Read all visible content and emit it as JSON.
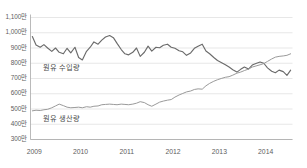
{
  "chart_data": {
    "type": "line",
    "title": "",
    "subtitle": "",
    "xlabel": "",
    "ylabel": "",
    "unit_suffix": "만",
    "grid": true,
    "legend_position": "inline-annotation",
    "ylim": [
      300,
      1100
    ],
    "yticks": [
      1100,
      1000,
      900,
      800,
      700,
      600,
      500,
      400,
      300
    ],
    "ytick_labels": [
      "1,100만",
      "1,000만",
      "900만",
      "800만",
      "700만",
      "600만",
      "500만",
      "400만",
      "300만"
    ],
    "xlim": [
      2008.92,
      2014.58
    ],
    "xticks": [
      2009,
      2010,
      2011,
      2012,
      2013,
      2014
    ],
    "xtick_labels": [
      "2009",
      "2010",
      "2011",
      "2012",
      "2013",
      "2014"
    ],
    "colors": {
      "imports_line": "#6b6b6b",
      "production_line": "#9a9a9a",
      "grid": "#dcdcdc",
      "axis": "#a8a8a8",
      "tick_text": "#5d5d5d",
      "label_text": "#4a4a4a",
      "background": "#ffffff"
    },
    "series": [
      {
        "name": "원유 수입량",
        "label_x": 2009.2,
        "label_y": 772,
        "color": "#6b6b6b",
        "x": [
          2008.96,
          2009.04,
          2009.13,
          2009.21,
          2009.29,
          2009.38,
          2009.46,
          2009.54,
          2009.63,
          2009.71,
          2009.79,
          2009.88,
          2009.96,
          2010.04,
          2010.13,
          2010.21,
          2010.29,
          2010.38,
          2010.46,
          2010.54,
          2010.63,
          2010.71,
          2010.79,
          2010.88,
          2010.96,
          2011.04,
          2011.13,
          2011.21,
          2011.29,
          2011.38,
          2011.46,
          2011.54,
          2011.63,
          2011.71,
          2011.79,
          2011.88,
          2011.96,
          2012.04,
          2012.13,
          2012.21,
          2012.29,
          2012.38,
          2012.46,
          2012.54,
          2012.63,
          2012.71,
          2012.79,
          2012.88,
          2012.96,
          2013.04,
          2013.13,
          2013.21,
          2013.29,
          2013.38,
          2013.46,
          2013.54,
          2013.63,
          2013.71,
          2013.79,
          2013.88,
          2013.96,
          2014.04,
          2014.13,
          2014.21,
          2014.29,
          2014.38,
          2014.46,
          2014.54
        ],
        "values": [
          975,
          920,
          905,
          922,
          900,
          878,
          900,
          872,
          862,
          898,
          868,
          905,
          838,
          822,
          878,
          905,
          940,
          925,
          952,
          972,
          982,
          968,
          930,
          890,
          862,
          855,
          872,
          900,
          845,
          872,
          912,
          880,
          905,
          902,
          918,
          925,
          905,
          898,
          882,
          875,
          852,
          868,
          898,
          912,
          925,
          880,
          862,
          838,
          818,
          805,
          790,
          775,
          758,
          742,
          760,
          775,
          762,
          788,
          798,
          808,
          800,
          770,
          748,
          738,
          755,
          745,
          720,
          755
        ]
      },
      {
        "name": "원유 생산량",
        "label_x": 2009.2,
        "label_y": 432,
        "color": "#9a9a9a",
        "x": [
          2008.96,
          2009.04,
          2009.13,
          2009.21,
          2009.29,
          2009.38,
          2009.46,
          2009.54,
          2009.63,
          2009.71,
          2009.79,
          2009.88,
          2009.96,
          2010.04,
          2010.13,
          2010.21,
          2010.29,
          2010.38,
          2010.46,
          2010.54,
          2010.63,
          2010.71,
          2010.79,
          2010.88,
          2010.96,
          2011.04,
          2011.13,
          2011.21,
          2011.29,
          2011.38,
          2011.46,
          2011.54,
          2011.63,
          2011.71,
          2011.79,
          2011.88,
          2011.96,
          2012.04,
          2012.13,
          2012.21,
          2012.29,
          2012.38,
          2012.46,
          2012.54,
          2012.63,
          2012.71,
          2012.79,
          2012.88,
          2012.96,
          2013.04,
          2013.13,
          2013.21,
          2013.29,
          2013.38,
          2013.46,
          2013.54,
          2013.63,
          2013.71,
          2013.79,
          2013.88,
          2013.96,
          2014.04,
          2014.13,
          2014.21,
          2014.29,
          2014.38,
          2014.46,
          2014.54
        ],
        "values": [
          488,
          492,
          490,
          495,
          498,
          508,
          520,
          532,
          522,
          512,
          508,
          510,
          512,
          508,
          515,
          512,
          518,
          520,
          528,
          530,
          532,
          530,
          528,
          532,
          530,
          528,
          532,
          538,
          548,
          542,
          528,
          518,
          532,
          545,
          552,
          558,
          562,
          578,
          592,
          602,
          612,
          618,
          628,
          632,
          630,
          652,
          668,
          682,
          692,
          700,
          708,
          712,
          722,
          735,
          742,
          752,
          762,
          775,
          782,
          790,
          798,
          812,
          828,
          840,
          845,
          848,
          852,
          862
        ]
      }
    ]
  }
}
